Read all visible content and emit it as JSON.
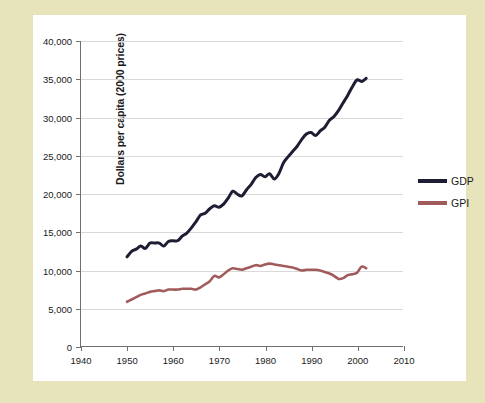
{
  "figure": {
    "frame_color": "#e7e3bb",
    "canvas_color": "#ffffff"
  },
  "chart_data": {
    "type": "line",
    "title": "",
    "subtitle": "",
    "xlabel": "",
    "ylabel": "Dollars per capita (2000 prices)",
    "xlim": [
      1940,
      2010
    ],
    "ylim": [
      0,
      40000
    ],
    "grid": "horizontal",
    "legend_position": "right",
    "xticks": [
      "1940",
      "1950",
      "1960",
      "1970",
      "1980",
      "1990",
      "2000",
      "2010"
    ],
    "xtick_values": [
      1940,
      1950,
      1960,
      1970,
      1980,
      1990,
      2000,
      2010
    ],
    "yticks": [
      "0",
      "5,000",
      "10,000",
      "15,000",
      "20,000",
      "25,000",
      "30,000",
      "35,000",
      "40,000"
    ],
    "ytick_values": [
      0,
      5000,
      10000,
      15000,
      20000,
      25000,
      30000,
      35000,
      40000
    ],
    "x": [
      1950,
      1951,
      1952,
      1953,
      1954,
      1955,
      1956,
      1957,
      1958,
      1959,
      1960,
      1961,
      1962,
      1963,
      1964,
      1965,
      1966,
      1967,
      1968,
      1969,
      1970,
      1971,
      1972,
      1973,
      1974,
      1975,
      1976,
      1977,
      1978,
      1979,
      1980,
      1981,
      1982,
      1983,
      1984,
      1985,
      1986,
      1987,
      1988,
      1989,
      1990,
      1991,
      1992,
      1993,
      1994,
      1995,
      1996,
      1997,
      1998,
      1999,
      2000,
      2001,
      2002
    ],
    "series": [
      {
        "name": "GDP",
        "color": "#1d1d33",
        "width": 3.0,
        "values": [
          11700,
          12400,
          12700,
          13100,
          12800,
          13500,
          13500,
          13500,
          13100,
          13700,
          13800,
          13800,
          14400,
          14800,
          15500,
          16300,
          17200,
          17400,
          18000,
          18400,
          18200,
          18600,
          19400,
          20300,
          19900,
          19700,
          20500,
          21200,
          22100,
          22500,
          22200,
          22600,
          21900,
          22600,
          24000,
          24800,
          25500,
          26200,
          27100,
          27800,
          28000,
          27600,
          28200,
          28700,
          29600,
          30100,
          30900,
          31900,
          32900,
          34000,
          34900,
          34700,
          35100
        ]
      },
      {
        "name": "GPI",
        "color": "#a25b5b",
        "width": 2.6,
        "values": [
          5800,
          6100,
          6400,
          6700,
          6900,
          7100,
          7200,
          7300,
          7200,
          7400,
          7400,
          7400,
          7500,
          7500,
          7500,
          7400,
          7700,
          8100,
          8500,
          9200,
          9000,
          9400,
          9900,
          10200,
          10100,
          10000,
          10200,
          10400,
          10600,
          10500,
          10700,
          10800,
          10700,
          10600,
          10500,
          10400,
          10300,
          10100,
          9900,
          10000,
          10000,
          10000,
          9900,
          9700,
          9500,
          9200,
          8800,
          8900,
          9300,
          9400,
          9600,
          10400,
          10200
        ]
      }
    ]
  },
  "legend": {
    "items": [
      {
        "label": "GDP",
        "color": "#1d1d33"
      },
      {
        "label": "GPI",
        "color": "#a25b5b"
      }
    ]
  }
}
